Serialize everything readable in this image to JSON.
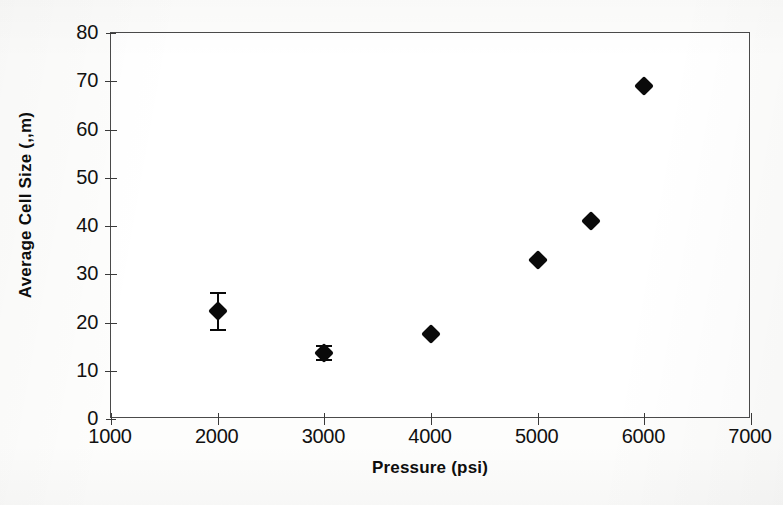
{
  "chart_data": {
    "type": "scatter",
    "title": "",
    "xlabel": "Pressure (psi)",
    "ylabel": "Average Cell Size (,,m)",
    "xlim": [
      1000,
      7000
    ],
    "ylim": [
      0,
      80
    ],
    "xticks": [
      1000,
      2000,
      3000,
      4000,
      5000,
      6000,
      7000
    ],
    "yticks": [
      0,
      10,
      20,
      30,
      40,
      50,
      60,
      70,
      80
    ],
    "xtick_labels": [
      "1000",
      "2000",
      "3000",
      "4000",
      "5000",
      "6000",
      "7000"
    ],
    "ytick_labels": [
      "0",
      "10",
      "20",
      "30",
      "40",
      "50",
      "60",
      "70",
      "80"
    ],
    "grid": false,
    "legend": false,
    "marker_style": "filled-diamond",
    "marker_color": "#0a0a0a",
    "frame_color": "#4a4a4a",
    "background_color": "#ffffff",
    "series": [
      {
        "name": "Average Cell Size",
        "points": [
          {
            "x": 2000,
            "y": 22.3,
            "yerr": 4.0,
            "has_error_bar": true
          },
          {
            "x": 3000,
            "y": 13.7,
            "yerr": 1.6,
            "has_error_bar": true
          },
          {
            "x": 4000,
            "y": 17.7,
            "yerr": 0.0,
            "has_error_bar": false
          },
          {
            "x": 5000,
            "y": 33.0,
            "yerr": 0.0,
            "has_error_bar": false
          },
          {
            "x": 5500,
            "y": 41.0,
            "yerr": 0.0,
            "has_error_bar": false
          },
          {
            "x": 6000,
            "y": 69.0,
            "yerr": 0.0,
            "has_error_bar": false
          }
        ]
      }
    ]
  }
}
